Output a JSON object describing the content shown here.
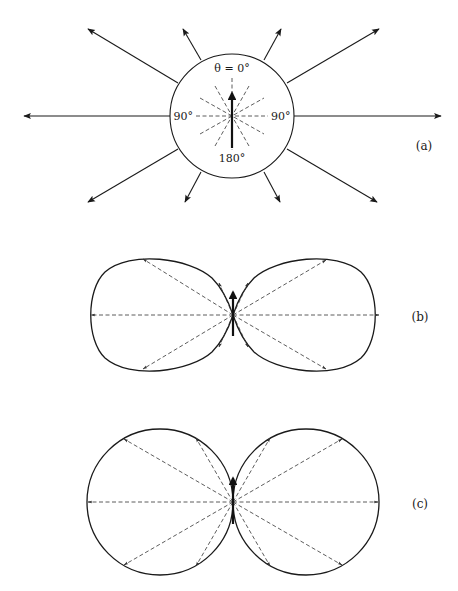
{
  "figure": {
    "panels": [
      {
        "id": "a",
        "label": "(a)",
        "description": "Isotropic radiation: circle with radial arrows",
        "angle_labels": {
          "top": "θ = 0°",
          "left": "90°",
          "right": "90°",
          "bottom": "180°"
        }
      },
      {
        "id": "b",
        "label": "(b)",
        "description": "Dipole radiation pattern (two lobes) with dashed radial arrows"
      },
      {
        "id": "c",
        "label": "(c)",
        "description": "Two tangent circles radiation pattern with dashed radial arrows"
      }
    ],
    "colors": {
      "line": "#1a1a1a",
      "background": "#ffffff"
    }
  }
}
